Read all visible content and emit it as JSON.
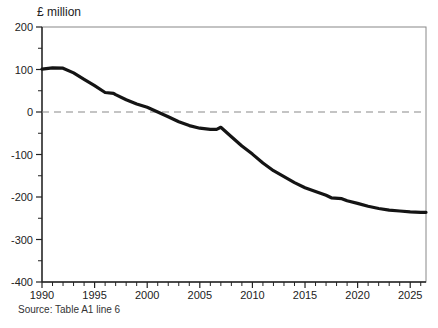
{
  "chart": {
    "title": "£ million",
    "source": "Source: Table A1 line 6"
  },
  "chart_data": {
    "type": "line",
    "title": "£ million",
    "source_note": "Source: Table A1 line 6",
    "xlim": [
      1990,
      2026.5
    ],
    "ylim": [
      -400,
      200
    ],
    "x_ticks_major": [
      1990,
      1995,
      2000,
      2005,
      2010,
      2015,
      2020,
      2025
    ],
    "x_minor_step": 1,
    "y_ticks_major": [
      200,
      100,
      0,
      -100,
      -200,
      -300,
      -400
    ],
    "y_minor_step": 50,
    "grid": false,
    "legend": "none",
    "zero_line": {
      "style": "dashed",
      "color": "#8a8a8a",
      "dash": "7 5",
      "at": 0
    },
    "line_color": "#141414",
    "line_width": 3.2,
    "frame_color": "#888888",
    "axis_color": "#222222",
    "tick_label_color": "#222222",
    "tick_font_size": 11,
    "plot_area": {
      "left": 42,
      "top": 27,
      "right": 426,
      "bottom": 282
    },
    "series": [
      {
        "name": "balance",
        "x": [
          1990,
          1991,
          1992,
          1993,
          1994,
          1995,
          1996,
          1996.8,
          1997,
          1998,
          1999,
          2000,
          2001,
          2002,
          2003,
          2004,
          2005,
          2006,
          2006.6,
          2007,
          2008,
          2009,
          2010,
          2011,
          2012,
          2013,
          2014,
          2015,
          2016,
          2017,
          2017.5,
          2018.5,
          2019,
          2020,
          2021,
          2022,
          2023,
          2024,
          2025,
          2026,
          2026.5
        ],
        "values": [
          101,
          104,
          103,
          92,
          77,
          62,
          46,
          44,
          41,
          29,
          19,
          11,
          0,
          -11,
          -23,
          -32,
          -38,
          -41,
          -41,
          -36,
          -58,
          -80,
          -99,
          -120,
          -138,
          -152,
          -166,
          -178,
          -187,
          -196,
          -202,
          -204,
          -209,
          -215,
          -222,
          -227,
          -231,
          -233,
          -235,
          -236,
          -236
        ]
      }
    ]
  }
}
